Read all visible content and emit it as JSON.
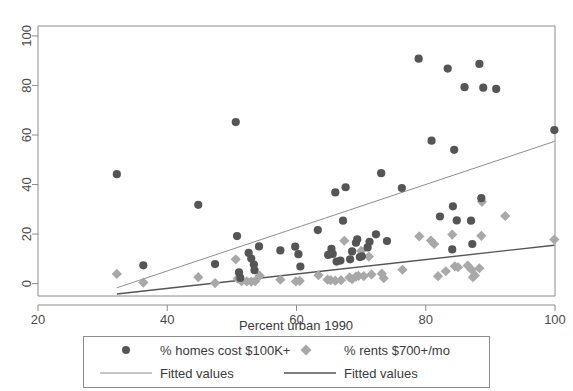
{
  "chart_data": {
    "type": "scatter",
    "title": "",
    "xlabel": "Percent urban 1990",
    "ylabel": "",
    "xlim": [
      20,
      100
    ],
    "ylim": [
      -5,
      104
    ],
    "xticks": [
      20,
      40,
      60,
      80,
      100
    ],
    "yticks": [
      0,
      20,
      40,
      60,
      80,
      100
    ],
    "xtick_labels": [
      "20",
      "40",
      "60",
      "80",
      "100"
    ],
    "ytick_labels": [
      "0",
      "20",
      "40",
      "60",
      "80",
      "100"
    ],
    "grid": false,
    "legend_position": "below-axes",
    "series": [
      {
        "name": "% homes cost $100K+",
        "marker": "circle",
        "color": "#555555",
        "points": [
          [
            32.2,
            44.2
          ],
          [
            36.3,
            7.4
          ],
          [
            44.8,
            31.8
          ],
          [
            50.6,
            65.2
          ],
          [
            50.8,
            19.2
          ],
          [
            47.4,
            7.9
          ],
          [
            51.1,
            4.5
          ],
          [
            51.3,
            2.3
          ],
          [
            52.6,
            12.4
          ],
          [
            53.0,
            10.1
          ],
          [
            53.4,
            7.7
          ],
          [
            53.5,
            5.4
          ],
          [
            54.2,
            15.0
          ],
          [
            57.5,
            13.4
          ],
          [
            59.8,
            14.9
          ],
          [
            60.3,
            11.9
          ],
          [
            60.6,
            6.9
          ],
          [
            63.3,
            21.6
          ],
          [
            64.9,
            11.6
          ],
          [
            65.4,
            14.0
          ],
          [
            66.0,
            36.8
          ],
          [
            66.2,
            8.9
          ],
          [
            66.8,
            9.3
          ],
          [
            67.2,
            25.4
          ],
          [
            67.6,
            38.9
          ],
          [
            68.3,
            9.8
          ],
          [
            68.6,
            13.0
          ],
          [
            69.2,
            16.5
          ],
          [
            69.4,
            17.9
          ],
          [
            69.8,
            10.7
          ],
          [
            71.0,
            14.6
          ],
          [
            71.3,
            16.9
          ],
          [
            72.3,
            19.9
          ],
          [
            73.1,
            44.6
          ],
          [
            74.0,
            17.2
          ],
          [
            76.3,
            38.6
          ],
          [
            78.9,
            90.8
          ],
          [
            80.9,
            57.7
          ],
          [
            82.2,
            27.1
          ],
          [
            83.4,
            86.8
          ],
          [
            84.4,
            54.0
          ],
          [
            84.2,
            31.2
          ],
          [
            84.1,
            13.8
          ],
          [
            84.8,
            25.5
          ],
          [
            86.0,
            79.3
          ],
          [
            87.0,
            25.4
          ],
          [
            87.2,
            16.0
          ],
          [
            88.3,
            88.7
          ],
          [
            88.6,
            34.5
          ],
          [
            88.9,
            79.1
          ],
          [
            90.9,
            78.6
          ],
          [
            99.9,
            62.0
          ],
          [
            65.6,
            12.0
          ],
          [
            70.1,
            11.0
          ]
        ]
      },
      {
        "name": "% rents $700+/mo",
        "marker": "diamond",
        "color": "#a8a8a8",
        "points": [
          [
            32.2,
            3.9
          ],
          [
            36.3,
            0.4
          ],
          [
            44.8,
            2.6
          ],
          [
            47.4,
            0.2
          ],
          [
            50.6,
            9.8
          ],
          [
            50.9,
            2.0
          ],
          [
            51.5,
            1.0
          ],
          [
            52.3,
            0.9
          ],
          [
            53.0,
            0.8
          ],
          [
            53.6,
            1.0
          ],
          [
            54.3,
            3.2
          ],
          [
            57.5,
            1.6
          ],
          [
            59.9,
            0.9
          ],
          [
            60.5,
            1.1
          ],
          [
            63.4,
            3.4
          ],
          [
            64.8,
            1.6
          ],
          [
            65.3,
            1.4
          ],
          [
            66.0,
            1.2
          ],
          [
            66.9,
            1.4
          ],
          [
            67.4,
            17.3
          ],
          [
            68.2,
            2.5
          ],
          [
            68.6,
            1.8
          ],
          [
            69.2,
            2.8
          ],
          [
            69.6,
            3.1
          ],
          [
            70.0,
            13.2
          ],
          [
            70.4,
            3.0
          ],
          [
            71.2,
            10.9
          ],
          [
            71.6,
            3.7
          ],
          [
            73.2,
            4.0
          ],
          [
            73.5,
            2.2
          ],
          [
            76.4,
            5.6
          ],
          [
            79.0,
            19.1
          ],
          [
            80.8,
            17.4
          ],
          [
            81.3,
            16.0
          ],
          [
            81.9,
            3.0
          ],
          [
            83.1,
            5.0
          ],
          [
            84.1,
            19.8
          ],
          [
            84.5,
            7.0
          ],
          [
            85.0,
            6.6
          ],
          [
            86.5,
            7.3
          ],
          [
            87.1,
            5.6
          ],
          [
            87.3,
            2.6
          ],
          [
            87.6,
            3.3
          ],
          [
            88.3,
            6.2
          ],
          [
            88.7,
            33.0
          ],
          [
            88.6,
            19.3
          ],
          [
            92.3,
            27.3
          ],
          [
            99.9,
            17.8
          ]
        ]
      }
    ],
    "fits": [
      {
        "name": "Fitted values",
        "for": "% homes cost $100K+",
        "color": "#8e8e8e",
        "width": 1,
        "x0": 32.2,
        "y0": -1.7,
        "x1": 99.9,
        "y1": 57.4
      },
      {
        "name": "Fitted values",
        "for": "% rents $700+/mo",
        "color": "#555555",
        "width": 1.4,
        "x0": 32.2,
        "y0": -4.2,
        "x1": 99.9,
        "y1": 15.5
      }
    ]
  },
  "axes": {
    "x_title": "Percent urban 1990",
    "x_tick_labels": [
      "20",
      "40",
      "60",
      "80",
      "100"
    ],
    "y_tick_labels": [
      "0",
      "20",
      "40",
      "60",
      "80",
      "100"
    ]
  },
  "legend": {
    "entries": [
      {
        "label": "% homes cost $100K+",
        "marker": "circle",
        "color": "#555555"
      },
      {
        "label": "% rents $700+/mo",
        "marker": "diamond",
        "color": "#a8a8a8"
      },
      {
        "label": "Fitted values",
        "marker": "line-thin",
        "color": "#8e8e8e"
      },
      {
        "label": "Fitted values",
        "marker": "line-thick",
        "color": "#555555"
      }
    ]
  },
  "colors": {
    "circle_series": "#555555",
    "diamond_series": "#a8a8a8",
    "fit_line_homes": "#8e8e8e",
    "fit_line_rents": "#555555",
    "frame": "#8c8c8c",
    "background": "#ffffff"
  }
}
